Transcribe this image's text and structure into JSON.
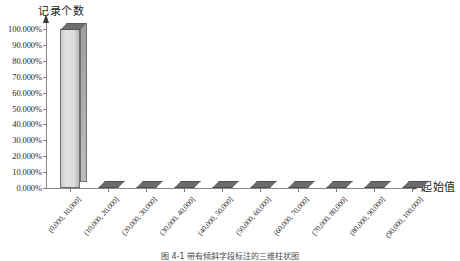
{
  "chart_data": {
    "type": "bar",
    "title": "",
    "subtitle": "",
    "ylabel": "记录个数",
    "xlabel": "起始值",
    "categories": [
      "(0,000, 10,000]",
      "(10,000, 20,000]",
      "(20,000, 30,000]",
      "(30,000, 40,000]",
      "(40,000, 50,000]",
      "(50,000, 60,000]",
      "(60,000, 70,000]",
      "(70,000, 80,000]",
      "(80,000, 90,000]",
      "(90,000, 100,000]"
    ],
    "values": [
      100.0,
      0.0,
      0.0,
      0.0,
      0.0,
      0.0,
      0.0,
      0.0,
      0.0,
      0.0
    ],
    "ytick_labels": [
      "100.000%",
      "90.000%",
      "80.000%",
      "70.000%",
      "60.000%",
      "50.000%",
      "40.000%",
      "30.000%",
      "20.000%",
      "10.000%",
      "0.000%"
    ],
    "ytick_values": [
      100,
      90,
      80,
      70,
      60,
      50,
      40,
      30,
      20,
      10,
      0
    ],
    "ylim": [
      0,
      100
    ],
    "value_unit": "%",
    "grid": false,
    "legend": false,
    "legend_position": "none",
    "style": "3d-column",
    "colors": {
      "bar_face": "#dcdcdc",
      "bar_top": "#6e6e6e",
      "bar_side": "#aaaaaa",
      "bar_outline": "#6e6e6e",
      "axis": "#8a8a8a",
      "text": "#2b2b2b",
      "background": "#ffffff"
    }
  },
  "caption": {
    "text": "图 4-1  带有倾斜字段标注的三维柱状图"
  }
}
